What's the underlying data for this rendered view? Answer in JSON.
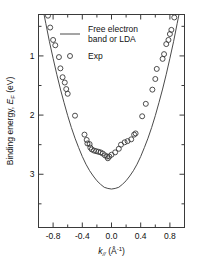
{
  "chart_data": {
    "type": "scatter",
    "title": "",
    "xlabel": "k∥ (Å⁻¹)",
    "ylabel": "Binding energy, EF (eV)",
    "xlabel_parts": {
      "symbol": "k",
      "sub": "//",
      "units": "(Å",
      "sup": "-1",
      "units_end": ")"
    },
    "ylabel_parts": {
      "prefix": "Binding energy, ",
      "symbol": "E",
      "sub": "F",
      "units": " (eV)"
    },
    "xlim": [
      -1.0,
      1.0
    ],
    "ylim_binding": [
      0.3,
      3.9
    ],
    "y_axis_inverted": true,
    "grid": false,
    "xticks": [
      -0.8,
      -0.4,
      0.0,
      0.4,
      0.8
    ],
    "xticklabels": [
      "-0.8",
      "-0.4",
      "0.0",
      "0.4",
      "0.8"
    ],
    "xminorticks": [
      -0.6,
      -0.2,
      0.2,
      0.6
    ],
    "yticks": [
      1,
      2,
      3
    ],
    "yticklabels": [
      "1",
      "2",
      "3"
    ],
    "yminorticks": [
      0.5,
      1.5,
      2.5,
      3.5
    ],
    "legend": {
      "position": "upper-center",
      "entries": [
        {
          "label_line1": "Free electron",
          "label_line2": "band or LDA",
          "marker": "line"
        },
        {
          "label_line1": "Exp",
          "label_line2": "",
          "marker": "circle"
        }
      ]
    },
    "series": [
      {
        "name": "Free electron band or LDA",
        "type": "line",
        "model": "parabola",
        "vertex_k": 0.0,
        "vertex_binding_energy": 3.25,
        "curvature_eV_per_invA2": 3.45,
        "x": [
          -0.95,
          -0.9,
          -0.85,
          -0.8,
          -0.75,
          -0.7,
          -0.65,
          -0.6,
          -0.55,
          -0.5,
          -0.45,
          -0.4,
          -0.35,
          -0.3,
          -0.25,
          -0.2,
          -0.15,
          -0.1,
          -0.05,
          0.0,
          0.05,
          0.1,
          0.15,
          0.2,
          0.25,
          0.3,
          0.35,
          0.4,
          0.45,
          0.5,
          0.55,
          0.6,
          0.65,
          0.7,
          0.75,
          0.8,
          0.85,
          0.9,
          0.95
        ],
        "y": [
          0.14,
          0.45,
          0.76,
          1.04,
          1.31,
          1.56,
          1.79,
          2.01,
          2.21,
          2.39,
          2.55,
          2.7,
          2.83,
          2.94,
          3.03,
          3.11,
          3.17,
          3.22,
          3.24,
          3.25,
          3.24,
          3.22,
          3.17,
          3.11,
          3.03,
          2.94,
          2.83,
          2.7,
          2.55,
          2.39,
          2.21,
          2.01,
          1.79,
          1.56,
          1.31,
          1.04,
          0.76,
          0.45,
          0.14
        ]
      },
      {
        "name": "Exp",
        "type": "scatter",
        "marker": "open-circle",
        "points": [
          [
            -0.87,
            0.32
          ],
          [
            -0.84,
            0.52
          ],
          [
            -0.8,
            0.73
          ],
          [
            -0.77,
            0.82
          ],
          [
            -0.72,
            1.02
          ],
          [
            -0.7,
            1.21
          ],
          [
            -0.67,
            1.36
          ],
          [
            -0.64,
            1.45
          ],
          [
            -0.62,
            1.56
          ],
          [
            -0.6,
            1.64
          ],
          [
            -0.5,
            2.01
          ],
          [
            -0.37,
            2.33
          ],
          [
            -0.34,
            2.42
          ],
          [
            -0.33,
            2.48
          ],
          [
            -0.3,
            2.49
          ],
          [
            -0.29,
            2.55
          ],
          [
            -0.27,
            2.58
          ],
          [
            -0.24,
            2.6
          ],
          [
            -0.21,
            2.61
          ],
          [
            -0.18,
            2.62
          ],
          [
            -0.15,
            2.63
          ],
          [
            -0.12,
            2.65
          ],
          [
            -0.09,
            2.68
          ],
          [
            -0.06,
            2.7
          ],
          [
            -0.05,
            2.73
          ],
          [
            -0.03,
            2.7
          ],
          [
            0.0,
            2.67
          ],
          [
            0.05,
            2.63
          ],
          [
            0.1,
            2.57
          ],
          [
            0.13,
            2.5
          ],
          [
            0.18,
            2.46
          ],
          [
            0.22,
            2.44
          ],
          [
            0.27,
            2.41
          ],
          [
            0.31,
            2.33
          ],
          [
            0.33,
            2.31
          ],
          [
            0.42,
            2.02
          ],
          [
            0.47,
            1.81
          ],
          [
            0.56,
            1.57
          ],
          [
            0.6,
            1.39
          ],
          [
            0.62,
            1.22
          ],
          [
            0.7,
            1.05
          ],
          [
            0.72,
            0.97
          ],
          [
            0.75,
            0.8
          ],
          [
            0.78,
            0.73
          ],
          [
            0.8,
            0.63
          ],
          [
            0.82,
            0.56
          ],
          [
            0.86,
            0.35
          ],
          [
            0.88,
            0.26
          ]
        ]
      }
    ]
  }
}
